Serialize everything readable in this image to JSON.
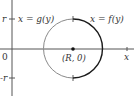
{
  "diagram": {
    "axes": {
      "x_label": "x",
      "origin_label": "0",
      "y_tick_top": "r",
      "y_tick_bottom": "-r"
    },
    "center_label": "(R, 0)",
    "left_curve_label": "x = g(y)",
    "right_curve_label": "x = f(y)",
    "colors": {
      "axis": "#555555",
      "left_curve": "#8a8a8a",
      "right_curve": "#1a1a1a",
      "text": "#333333"
    }
  }
}
